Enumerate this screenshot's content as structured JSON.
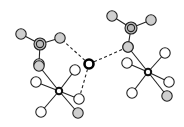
{
  "diagram": {
    "type": "molecular-structure",
    "colors": {
      "bond": "#222222",
      "gray_atom": "#cfcfcf",
      "white_atom": "#ffffff",
      "background": "#ffffff"
    },
    "central_atom": {
      "x": 89,
      "y": 64,
      "r": 4.5
    },
    "anion_groups": [
      {
        "center": {
          "x": 40,
          "y": 44,
          "r": 6
        },
        "ligands": [
          {
            "x": 21,
            "y": 34
          },
          {
            "x": 60,
            "y": 38
          },
          {
            "x": 39,
            "y": 64
          }
        ]
      },
      {
        "center": {
          "x": 131,
          "y": 28,
          "r": 6
        },
        "ligands": [
          {
            "x": 112,
            "y": 16
          },
          {
            "x": 151,
            "y": 20
          },
          {
            "x": 128,
            "y": 47
          }
        ]
      }
    ],
    "complexes": [
      {
        "metal": {
          "x": 59,
          "y": 91
        },
        "ligands": [
          {
            "x": 39,
            "y": 66,
            "kind": "gray"
          },
          {
            "x": 36,
            "y": 82,
            "kind": "white"
          },
          {
            "x": 75,
            "y": 70,
            "kind": "white"
          },
          {
            "x": 79,
            "y": 99,
            "kind": "white"
          },
          {
            "x": 78,
            "y": 113,
            "kind": "gray"
          },
          {
            "x": 41,
            "y": 112,
            "kind": "white"
          }
        ]
      },
      {
        "metal": {
          "x": 148,
          "y": 72
        },
        "ligands": [
          {
            "x": 128,
            "y": 47,
            "kind": "gray"
          },
          {
            "x": 127,
            "y": 63,
            "kind": "white"
          },
          {
            "x": 165,
            "y": 53,
            "kind": "white"
          },
          {
            "x": 169,
            "y": 82,
            "kind": "white"
          },
          {
            "x": 167,
            "y": 96,
            "kind": "gray"
          },
          {
            "x": 132,
            "y": 93,
            "kind": "white"
          }
        ]
      }
    ],
    "hydrogen_bonds": [
      {
        "from": [
          89,
          64
        ],
        "to": [
          60,
          38
        ]
      },
      {
        "from": [
          89,
          64
        ],
        "to": [
          128,
          47
        ]
      },
      {
        "from": [
          89,
          64
        ],
        "to": [
          79,
          99
        ]
      }
    ]
  }
}
